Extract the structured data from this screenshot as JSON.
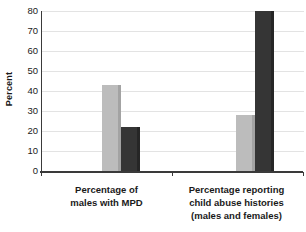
{
  "chart_data": {
    "type": "bar",
    "title": "",
    "xlabel": "",
    "ylabel": "Percent",
    "ylim": [
      0,
      80
    ],
    "yticks": [
      0,
      10,
      20,
      30,
      40,
      50,
      60,
      70,
      80
    ],
    "ytick_labels": [
      "0",
      "10",
      "20",
      "30",
      "40",
      "50",
      "60",
      "70",
      "80"
    ],
    "grid": true,
    "legend": "none",
    "categories": [
      "Percentage of males with MPD",
      "Percentage reporting child abuse histories (males and females)"
    ],
    "category_label_lines": [
      [
        "Percentage of",
        "males with MPD"
      ],
      [
        "Percentage reporting",
        "child abuse histories",
        "(males and females)"
      ]
    ],
    "series": [
      {
        "name": "light-gray-series",
        "color": "#bcbcbc",
        "values": [
          43,
          28
        ]
      },
      {
        "name": "dark-gray-series",
        "color": "#353535",
        "values": [
          22,
          80
        ]
      }
    ]
  },
  "colors": {
    "background": "#ffffff",
    "axis": "#3a3a3a",
    "gridline": "#e3e3e3",
    "text": "#1a1a1a",
    "bar_light": "#bcbcbc",
    "bar_light_side": "#a3a3a3",
    "bar_dark": "#353535",
    "bar_dark_side": "#262626"
  }
}
